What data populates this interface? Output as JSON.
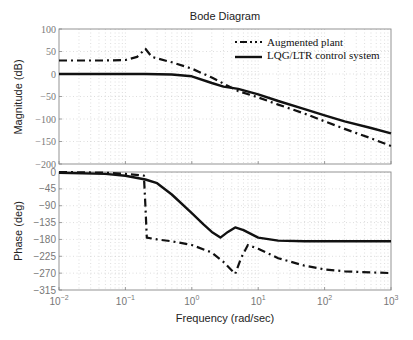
{
  "chart_data": {
    "type": "line",
    "title": "Bode Diagram",
    "xlabel": "Frequency (rad/sec)",
    "xscale": "log",
    "xlim": [
      0.01,
      1000
    ],
    "x_tick_labels": [
      "10^-2",
      "10^-1",
      "10^0",
      "10^1",
      "10^2",
      "10^3"
    ],
    "grid": true,
    "legend": {
      "position": "upper right of magnitude plot",
      "entries": [
        "Augmented plant",
        "LQG/LTR control system"
      ]
    },
    "subplots": [
      {
        "name": "magnitude",
        "ylabel": "Magnitude (dB)",
        "ylim": [
          -200,
          100
        ],
        "y_tick_labels": [
          "100",
          "50",
          "0",
          "-50",
          "-100",
          "-150",
          "-200"
        ],
        "series": [
          {
            "name": "Augmented plant",
            "style": "dash-dot",
            "x": [
              0.01,
              0.05,
              0.1,
              0.15,
              0.2,
              0.25,
              0.5,
              1,
              2,
              5,
              10,
              20,
              50,
              100,
              200,
              500,
              1000
            ],
            "values": [
              30,
              30,
              31,
              38,
              56,
              38,
              26,
              12,
              -8,
              -38,
              -52,
              -68,
              -88,
              -105,
              -122,
              -143,
              -160
            ]
          },
          {
            "name": "LQG/LTR control system",
            "style": "solid",
            "x": [
              0.01,
              0.1,
              0.2,
              0.5,
              1,
              2,
              3,
              5,
              10,
              20,
              50,
              100,
              200,
              500,
              1000
            ],
            "values": [
              0,
              0,
              0,
              -1,
              -5,
              -20,
              -28,
              -33,
              -45,
              -60,
              -78,
              -92,
              -105,
              -120,
              -132
            ]
          }
        ]
      },
      {
        "name": "phase",
        "ylabel": "Phase (deg)",
        "ylim": [
          -315,
          0
        ],
        "y_tick_labels": [
          "0",
          "-45",
          "-90",
          "-135",
          "-180",
          "-225",
          "-270",
          "-315"
        ],
        "series": [
          {
            "name": "Augmented plant",
            "style": "dash-dot",
            "x": [
              0.01,
              0.05,
              0.1,
              0.19,
              0.2,
              0.21,
              0.3,
              0.5,
              1,
              2,
              3,
              4.5,
              5.5,
              7,
              10,
              20,
              50,
              100,
              200,
              500,
              1000
            ],
            "values": [
              0,
              -2,
              -5,
              -10,
              -90,
              -175,
              -180,
              -185,
              -195,
              -215,
              -240,
              -272,
              -230,
              -195,
              -205,
              -230,
              -250,
              -260,
              -265,
              -268,
              -270
            ]
          },
          {
            "name": "LQG/LTR control system",
            "style": "solid",
            "x": [
              0.01,
              0.05,
              0.1,
              0.2,
              0.3,
              0.5,
              1,
              1.5,
              2,
              2.7,
              3.5,
              4.5,
              6,
              10,
              20,
              50,
              100,
              1000
            ],
            "values": [
              -2,
              -5,
              -10,
              -20,
              -30,
              -60,
              -110,
              -140,
              -160,
              -175,
              -160,
              -148,
              -155,
              -175,
              -183,
              -185,
              -185,
              -185
            ]
          }
        ]
      }
    ]
  }
}
